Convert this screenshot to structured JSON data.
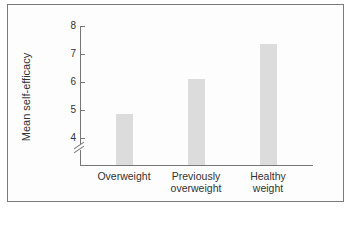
{
  "chart_data": {
    "type": "bar",
    "title": "",
    "xlabel": "",
    "ylabel": "Mean self-efficacy",
    "categories": [
      "Overweight",
      "Previously overweight",
      "Healthy weight"
    ],
    "category_lines": [
      [
        "Overweight"
      ],
      [
        "Previously",
        "overweight"
      ],
      [
        "Healthy",
        "weight"
      ]
    ],
    "values": [
      4.85,
      6.1,
      7.35
    ],
    "ylim": [
      3.3,
      8
    ],
    "yticks": [
      4,
      5,
      6,
      7,
      8
    ],
    "axis_break": true,
    "grid": false,
    "legend": null,
    "bar_color": "#dcdcdc"
  }
}
